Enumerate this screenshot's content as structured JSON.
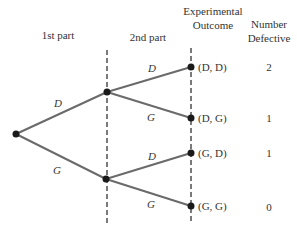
{
  "headers": {
    "first_part": "1st part",
    "second_part": "2nd part",
    "outcome_line1": "Experimental",
    "outcome_line2": "Outcome",
    "defective_line1": "Number",
    "defective_line2": "Defective"
  },
  "first_stage": {
    "upper_label": "D",
    "lower_label": "G"
  },
  "second_stage": {
    "upper_group": {
      "upper_label": "D",
      "lower_label": "G"
    },
    "lower_group": {
      "upper_label": "D",
      "lower_label": "G"
    }
  },
  "outcomes": [
    {
      "label": "(D, D)",
      "defective": "2"
    },
    {
      "label": "(D, G)",
      "defective": "1"
    },
    {
      "label": "(G, D)",
      "defective": "1"
    },
    {
      "label": "(G, G)",
      "defective": "0"
    }
  ],
  "colors": {
    "branch": "#6a6a6a",
    "node": "#1a1a1a",
    "dash": "#222222",
    "text": "#333333"
  }
}
